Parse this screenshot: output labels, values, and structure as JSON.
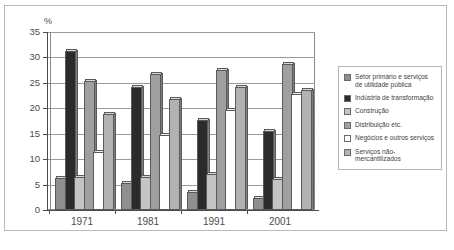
{
  "chart_data": {
    "type": "bar",
    "title": "",
    "xlabel": "",
    "ylabel": "%",
    "ylim": [
      0,
      35
    ],
    "yticks": [
      0,
      5,
      10,
      15,
      20,
      25,
      30,
      35
    ],
    "ytick_labels": [
      "0",
      "5",
      "10",
      "15",
      "20",
      "25",
      "30",
      "35"
    ],
    "grid": true,
    "legend_position": "right",
    "categories": [
      "1971",
      "1981",
      "1991",
      "2001"
    ],
    "series": [
      {
        "name": "Setor primário e serviços de utilidade pública",
        "color": "#8f8f8f",
        "values": [
          6.3,
          5.4,
          3.6,
          2.3
        ]
      },
      {
        "name": "Indústria de transformação",
        "color": "#2b2b2b",
        "values": [
          31.2,
          24.2,
          17.7,
          15.5
        ]
      },
      {
        "name": "Construção",
        "color": "#c4c4c4",
        "values": [
          6.4,
          6.4,
          7.1,
          6.1
        ]
      },
      {
        "name": "Distribuição etc.",
        "color": "#a0a0a0",
        "values": [
          25.3,
          26.8,
          27.5,
          28.8
        ]
      },
      {
        "name": "Negócios e outros serviços",
        "color": "#ffffff",
        "values": [
          11.5,
          14.8,
          19.6,
          22.8
        ]
      },
      {
        "name": "Serviços não-mercantilizados",
        "color": "#b2b2b2",
        "values": [
          18.8,
          21.9,
          24.1,
          23.6
        ]
      }
    ]
  },
  "axis": {
    "y_unit_label": "%"
  },
  "legend": {
    "items": [
      {
        "label": "Setor primário e serviços de utilidade pública",
        "color": "#8f8f8f"
      },
      {
        "label": "Indústria de transformação",
        "color": "#2b2b2b"
      },
      {
        "label": "Construção",
        "color": "#c4c4c4"
      },
      {
        "label": "Distribuição etc.",
        "color": "#a0a0a0"
      },
      {
        "label": "Negócios e outros serviços",
        "color": "#ffffff"
      },
      {
        "label": "Serviços não-mercantilizados",
        "color": "#b2b2b2"
      }
    ]
  },
  "footnote": {
    "text": ""
  }
}
